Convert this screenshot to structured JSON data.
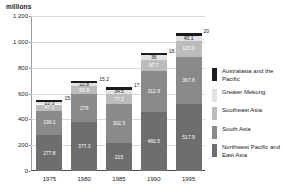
{
  "chart": {
    "axis_title": "millions",
    "yticks": [
      "1 200",
      "1 000",
      "800",
      "600",
      "400",
      "200",
      "0"
    ]
  },
  "legend": {
    "items": [
      {
        "label": "Australasia and the Pacific",
        "color": "#1c1c1c",
        "key": "australasia-pacific"
      },
      {
        "label": "Greater Mekong",
        "color": "#e2e2e2",
        "key": "greater-mekong"
      },
      {
        "label": "Southeast Asia",
        "color": "#bcbcbc",
        "key": "southeast-asia"
      },
      {
        "label": "South Asia",
        "color": "#8a8a8a",
        "key": "south-asia"
      },
      {
        "label": "Northwest Pacific and East Asia",
        "color": "#6e6e6e",
        "key": "northwest-pacific-east-asia"
      }
    ]
  },
  "chart_data": {
    "type": "bar",
    "subtype": "stacked",
    "title": "",
    "xlabel": "",
    "ylabel": "millions",
    "ylim": [
      0,
      1200
    ],
    "yticks": [
      0,
      200,
      400,
      600,
      800,
      1000,
      1200
    ],
    "grid": true,
    "legend_position": "right",
    "categories": [
      "1975",
      "1980",
      "1985",
      "1990",
      "1995"
    ],
    "series": [
      {
        "name": "Northwest Pacific and East Asia",
        "color": "#6e6e6e",
        "values": [
          277.8,
          377.3,
          215,
          460.5,
          517.9
        ],
        "labels": [
          "277.8",
          "377.3",
          "215",
          "460.5",
          "517.9"
        ]
      },
      {
        "name": "South Asia",
        "color": "#8a8a8a",
        "values": [
          190.1,
          219,
          302.5,
          312.9,
          367.8
        ],
        "labels": [
          "190.1",
          "279",
          "302.5",
          "312.9",
          "367.8"
        ]
      },
      {
        "name": "Southeast Asia",
        "color": "#bcbcbc",
        "values": [
          47.1,
          59.9,
          77.3,
          87.7,
          120.9
        ],
        "labels": [
          "47.1",
          "59.9",
          "77.3",
          "87.7",
          "120.9"
        ]
      },
      {
        "name": "Greater Mekong",
        "color": "#e2e2e2",
        "values": [
          22.3,
          22.8,
          34.5,
          36,
          40.1
        ],
        "labels": [
          "22.3",
          "22.8",
          "34.5",
          "36",
          "40.1"
        ]
      },
      {
        "name": "Australasia and the Pacific",
        "color": "#1c1c1c",
        "values": [
          15.4,
          15.2,
          17.4,
          18.8,
          20
        ],
        "labels": [
          "15.4",
          "15.2",
          "17.4",
          "18.8",
          "20"
        ]
      }
    ],
    "totals": [
      552.7,
      694.2,
      646.7,
      915.9,
      1066.7
    ]
  }
}
